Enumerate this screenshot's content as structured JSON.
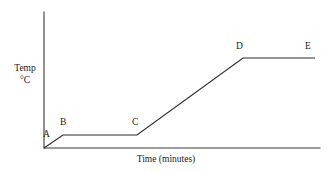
{
  "chart_data": {
    "type": "line",
    "title": "",
    "xlabel": "Time (minutes)",
    "ylabel_line1": "Temp",
    "ylabel_line2": "°C",
    "grid": false,
    "legend": false,
    "axes": {
      "x_range_px": [
        44,
        320
      ],
      "y_range_px": [
        148,
        12
      ],
      "ticks_shown": false,
      "tick_labels_x": [],
      "tick_labels_y": []
    },
    "series": [
      {
        "name": "heating curve",
        "color": "#2b2b2b",
        "points_px": [
          {
            "label": "A",
            "x": 44,
            "y": 148
          },
          {
            "label": "B",
            "x": 63,
            "y": 135
          },
          {
            "label": "C",
            "x": 137,
            "y": 135
          },
          {
            "label": "D",
            "x": 243,
            "y": 58
          },
          {
            "label": "E",
            "x": 315,
            "y": 58
          }
        ],
        "x": [
          0,
          7,
          34,
          72,
          98
        ],
        "values": [
          0,
          18,
          18,
          124,
          124
        ]
      }
    ],
    "point_labels": [
      {
        "text": "A",
        "left": 43,
        "top": 130
      },
      {
        "text": "B",
        "left": 60,
        "top": 118
      },
      {
        "text": "C",
        "left": 132,
        "top": 118
      },
      {
        "text": "D",
        "left": 236,
        "top": 42
      },
      {
        "text": "E",
        "left": 305,
        "top": 42
      }
    ],
    "annotations": {
      "segment_descriptions": [
        "A to B: rising",
        "B to C: flat plateau",
        "C to D: rising",
        "D to E: flat plateau"
      ]
    },
    "colors": {
      "background": "#ffffff",
      "axis": "#3a3a3a",
      "curve": "#2b2b2b",
      "text": "#1a1a1a"
    }
  }
}
